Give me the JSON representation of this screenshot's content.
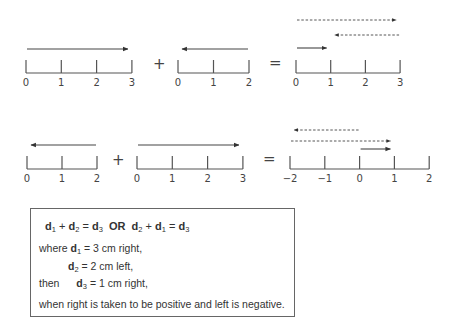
{
  "rows": [
    {
      "operands": [
        {
          "ticks": [
            "0",
            "1",
            "2",
            "3"
          ],
          "vectors": [
            {
              "from": 0,
              "to": 3,
              "style": "solid"
            }
          ]
        },
        {
          "ticks": [
            "0",
            "1",
            "2"
          ],
          "vectors": [
            {
              "from": 2,
              "to": 0,
              "style": "solid"
            }
          ]
        },
        {
          "ticks": [
            "0",
            "1",
            "2",
            "3"
          ],
          "vectors": [
            {
              "from": 0,
              "to": 3,
              "style": "dashed"
            },
            {
              "from": 3,
              "to": 1,
              "style": "dashed"
            },
            {
              "from": 0,
              "to": 1,
              "style": "solid"
            }
          ]
        }
      ],
      "operators": [
        "+",
        "="
      ]
    },
    {
      "operands": [
        {
          "ticks": [
            "0",
            "1",
            "2"
          ],
          "vectors": [
            {
              "from": 2,
              "to": 0,
              "style": "solid"
            }
          ]
        },
        {
          "ticks": [
            "0",
            "1",
            "2",
            "3"
          ],
          "vectors": [
            {
              "from": 0,
              "to": 3,
              "style": "solid"
            }
          ]
        },
        {
          "ticks": [
            "−2",
            "−1",
            "0",
            "1",
            "2"
          ],
          "vectors": [
            {
              "from": 0,
              "to": -2,
              "style": "dashed"
            },
            {
              "from": -2,
              "to": 1,
              "style": "dashed"
            },
            {
              "from": 0,
              "to": 1,
              "style": "solid"
            }
          ]
        }
      ],
      "operators": [
        "+",
        "="
      ]
    }
  ],
  "box": {
    "equation": {
      "d": "d",
      "s1": "1",
      "s2": "2",
      "s3": "3",
      "plus": "+",
      "eq": "=",
      "or": "OR"
    },
    "where": "where",
    "d1_value": "= 3 cm right,",
    "d2_value": "= 2 cm left,",
    "then": "then",
    "d3_value": "= 1 cm right,",
    "note": "when right is taken to be positive and left is negative."
  }
}
